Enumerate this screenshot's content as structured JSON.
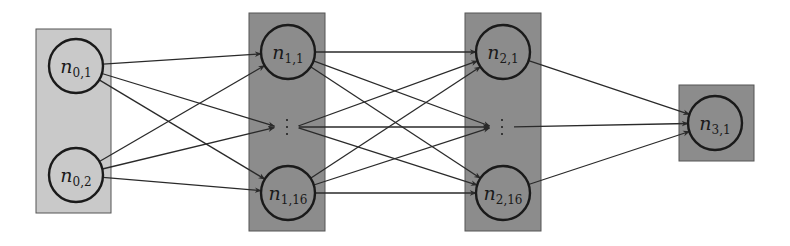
{
  "diagram": {
    "title": "",
    "type": "feed-forward neural network",
    "colors": {
      "input_layer_fill": "#c9c9c9",
      "hidden_layer_fill": "#8c8c8c",
      "output_layer_fill": "#8c8c8c",
      "box_border": "#555555",
      "node_stroke": "#1a1a1a",
      "edge": "#2a2a2a"
    },
    "layers": [
      {
        "id": "layer-0",
        "box": {
          "x": 36,
          "y": 29,
          "w": 75,
          "h": 184
        },
        "fill": "#c9c9c9",
        "nodes": [
          {
            "id": "n0_1",
            "base": "n",
            "sub": "0,1",
            "cx": 76,
            "cy": 66
          },
          {
            "id": "n0_2",
            "base": "n",
            "sub": "0,2",
            "cx": 76,
            "cy": 175
          }
        ]
      },
      {
        "id": "layer-1",
        "box": {
          "x": 249,
          "y": 13,
          "w": 76,
          "h": 218
        },
        "fill": "#8c8c8c",
        "nodes": [
          {
            "id": "n1_1",
            "base": "n",
            "sub": "1,1",
            "cx": 288,
            "cy": 52
          },
          {
            "id": "n1_dots",
            "ellipsis": true,
            "cx": 287,
            "cy": 127
          },
          {
            "id": "n1_16",
            "base": "n",
            "sub": "1,16",
            "cx": 288,
            "cy": 193
          }
        ]
      },
      {
        "id": "layer-2",
        "box": {
          "x": 465,
          "y": 13,
          "w": 76,
          "h": 218
        },
        "fill": "#8c8c8c",
        "nodes": [
          {
            "id": "n2_1",
            "base": "n",
            "sub": "2,1",
            "cx": 503,
            "cy": 52
          },
          {
            "id": "n2_dots",
            "ellipsis": true,
            "cx": 502,
            "cy": 127
          },
          {
            "id": "n2_16",
            "base": "n",
            "sub": "2,16",
            "cx": 503,
            "cy": 193
          }
        ]
      },
      {
        "id": "layer-3",
        "box": {
          "x": 679,
          "y": 85,
          "w": 75,
          "h": 76
        },
        "fill": "#8c8c8c",
        "nodes": [
          {
            "id": "n3_1",
            "base": "n",
            "sub": "3,1",
            "cx": 715,
            "cy": 123
          }
        ]
      }
    ],
    "node_radius": 27,
    "edges": [
      [
        "n0_1",
        "n1_1"
      ],
      [
        "n0_1",
        "n1_dots"
      ],
      [
        "n0_1",
        "n1_16"
      ],
      [
        "n0_2",
        "n1_1"
      ],
      [
        "n0_2",
        "n1_dots"
      ],
      [
        "n0_2",
        "n1_16"
      ],
      [
        "n1_1",
        "n2_1"
      ],
      [
        "n1_1",
        "n2_dots"
      ],
      [
        "n1_1",
        "n2_16"
      ],
      [
        "n1_dots",
        "n2_1"
      ],
      [
        "n1_dots",
        "n2_dots"
      ],
      [
        "n1_dots",
        "n2_16"
      ],
      [
        "n1_16",
        "n2_1"
      ],
      [
        "n1_16",
        "n2_dots"
      ],
      [
        "n1_16",
        "n2_16"
      ],
      [
        "n2_1",
        "n3_1"
      ],
      [
        "n2_dots",
        "n3_1"
      ],
      [
        "n2_16",
        "n3_1"
      ]
    ]
  }
}
